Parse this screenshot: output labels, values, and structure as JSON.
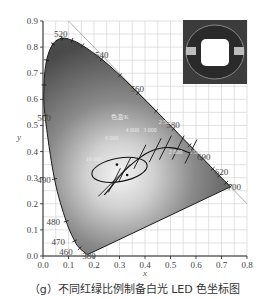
{
  "chart_data": {
    "type": "scatter",
    "title": "",
    "xlabel": "x",
    "ylabel": "y",
    "xlim": [
      0.0,
      0.8
    ],
    "ylim": [
      0.0,
      0.9
    ],
    "grid": true,
    "x_ticks": [
      "0.0",
      "0.1",
      "0.2",
      "0.3",
      "0.4",
      "0.5",
      "0.6",
      "0.7",
      "0.8"
    ],
    "y_ticks": [
      "0.0",
      "0.1",
      "0.2",
      "0.3",
      "0.4",
      "0.5",
      "0.6",
      "0.7",
      "0.8",
      "0.9"
    ],
    "spectral_locus": [
      {
        "nm": 380,
        "x": 0.174,
        "y": 0.005
      },
      {
        "nm": 460,
        "x": 0.144,
        "y": 0.03
      },
      {
        "nm": 470,
        "x": 0.124,
        "y": 0.058
      },
      {
        "nm": 480,
        "x": 0.091,
        "y": 0.133
      },
      {
        "nm": 490,
        "x": 0.045,
        "y": 0.295
      },
      {
        "nm": 500,
        "x": 0.008,
        "y": 0.538
      },
      {
        "nm": 505,
        "x": 0.004,
        "y": 0.655
      },
      {
        "nm": 510,
        "x": 0.014,
        "y": 0.75
      },
      {
        "nm": 515,
        "x": 0.039,
        "y": 0.812
      },
      {
        "nm": 520,
        "x": 0.074,
        "y": 0.834
      },
      {
        "nm": 525,
        "x": 0.114,
        "y": 0.826
      },
      {
        "nm": 530,
        "x": 0.155,
        "y": 0.806
      },
      {
        "nm": 540,
        "x": 0.23,
        "y": 0.754
      },
      {
        "nm": 550,
        "x": 0.302,
        "y": 0.692
      },
      {
        "nm": 560,
        "x": 0.373,
        "y": 0.624
      },
      {
        "nm": 570,
        "x": 0.444,
        "y": 0.555
      },
      {
        "nm": 580,
        "x": 0.512,
        "y": 0.487
      },
      {
        "nm": 590,
        "x": 0.575,
        "y": 0.424
      },
      {
        "nm": 600,
        "x": 0.627,
        "y": 0.373
      },
      {
        "nm": 610,
        "x": 0.666,
        "y": 0.334
      },
      {
        "nm": 620,
        "x": 0.691,
        "y": 0.308
      },
      {
        "nm": 640,
        "x": 0.719,
        "y": 0.281
      },
      {
        "nm": 700,
        "x": 0.735,
        "y": 0.265
      }
    ],
    "wavelength_labels": [
      {
        "text": "520",
        "x": 0.07,
        "y": 0.85
      },
      {
        "text": "540",
        "x": 0.23,
        "y": 0.77
      },
      {
        "text": "560",
        "x": 0.37,
        "y": 0.64
      },
      {
        "text": "580",
        "x": 0.51,
        "y": 0.5
      },
      {
        "text": "600",
        "x": 0.63,
        "y": 0.38
      },
      {
        "text": "620",
        "x": 0.7,
        "y": 0.32
      },
      {
        "text": "700",
        "x": 0.75,
        "y": 0.265
      },
      {
        "text": "500",
        "x": 0.0,
        "y": 0.53
      },
      {
        "text": "490",
        "x": 0.0,
        "y": 0.29
      },
      {
        "text": "480",
        "x": 0.04,
        "y": 0.13
      },
      {
        "text": "470",
        "x": 0.06,
        "y": 0.055
      },
      {
        "text": "460",
        "x": 0.09,
        "y": 0.015
      },
      {
        "text": "380",
        "x": 0.18,
        "y": 0.0
      }
    ],
    "planckian_locus": [
      {
        "x": 0.24,
        "y": 0.234
      },
      {
        "x": 0.26,
        "y": 0.256
      },
      {
        "x": 0.28,
        "y": 0.28
      },
      {
        "x": 0.31,
        "y": 0.316
      },
      {
        "x": 0.34,
        "y": 0.345
      },
      {
        "x": 0.38,
        "y": 0.377
      },
      {
        "x": 0.42,
        "y": 0.4
      },
      {
        "x": 0.46,
        "y": 0.413
      },
      {
        "x": 0.5,
        "y": 0.415
      },
      {
        "x": 0.54,
        "y": 0.408
      },
      {
        "x": 0.58,
        "y": 0.392
      }
    ],
    "cct_labels": [
      {
        "text": "色温/K",
        "x": 0.3,
        "y": 0.525
      },
      {
        "text": "10 000",
        "x": 0.2,
        "y": 0.365
      },
      {
        "text": "6 000",
        "x": 0.27,
        "y": 0.445
      },
      {
        "text": "4 000",
        "x": 0.35,
        "y": 0.475
      },
      {
        "text": "3 000",
        "x": 0.42,
        "y": 0.475
      },
      {
        "text": "2 500",
        "x": 0.48,
        "y": 0.505
      },
      {
        "text": "2 000",
        "x": 0.52,
        "y": 0.39
      },
      {
        "text": "1 500",
        "x": 0.6,
        "y": 0.39
      }
    ],
    "isotherms": [
      {
        "cct": "10000",
        "x": 0.28,
        "y": 0.29
      },
      {
        "cct": "6000",
        "x": 0.32,
        "y": 0.33
      },
      {
        "cct": "4000",
        "x": 0.38,
        "y": 0.38
      },
      {
        "cct": "3000",
        "x": 0.44,
        "y": 0.405
      },
      {
        "cct": "2500",
        "x": 0.48,
        "y": 0.415
      },
      {
        "cct": "2000",
        "x": 0.53,
        "y": 0.415
      },
      {
        "cct": "1500",
        "x": 0.58,
        "y": 0.4
      }
    ],
    "ellipse": {
      "cx": 0.3,
      "cy": 0.33,
      "rx": 0.11,
      "ry": 0.045,
      "angle_deg": -10
    },
    "data_points": [
      {
        "x": 0.29,
        "y": 0.35
      },
      {
        "x": 0.33,
        "y": 0.31
      }
    ],
    "diagonal_line": [
      {
        "x": 0.1,
        "y": 0.9
      },
      {
        "x": 0.8,
        "y": 0.2
      }
    ],
    "inset": "LED photo"
  },
  "caption": "（g）不同红绿比例制备白光 LED 色坐标图"
}
